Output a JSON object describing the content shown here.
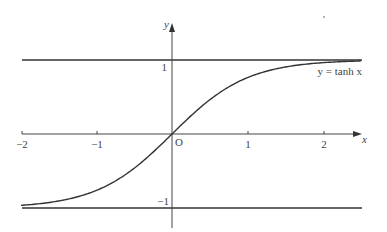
{
  "figure": {
    "curve_label": "y = tanh x",
    "axis_x_label": "x",
    "axis_y_label": "y",
    "origin_label": "O",
    "x_ticks": [
      "−2",
      "−1",
      "1",
      "2"
    ],
    "y_ticks": [
      "1",
      "−1"
    ],
    "asymptotes": [
      "y = 1",
      "y = −1"
    ],
    "colors": {
      "line": "#333333",
      "text": "#444444",
      "background": "#ffffff"
    }
  },
  "chart_data": {
    "type": "line",
    "title": "",
    "function": "y = tanh x",
    "xlabel": "x",
    "ylabel": "y",
    "xlim": [
      -2,
      2.5
    ],
    "ylim": [
      -1,
      1
    ],
    "x_ticks": [
      -2,
      -1,
      1,
      2
    ],
    "y_ticks": [
      1,
      -1
    ],
    "asymptotes": [
      1,
      -1
    ],
    "series": [
      {
        "name": "y = tanh x",
        "x": [
          -2.0,
          -1.5,
          -1.0,
          -0.5,
          0.0,
          0.5,
          1.0,
          1.5,
          2.0,
          2.5
        ],
        "values": [
          -0.964,
          -0.905,
          -0.762,
          -0.462,
          0.0,
          0.462,
          0.762,
          0.905,
          0.964,
          0.987
        ]
      }
    ],
    "grid": false,
    "legend": "none"
  }
}
